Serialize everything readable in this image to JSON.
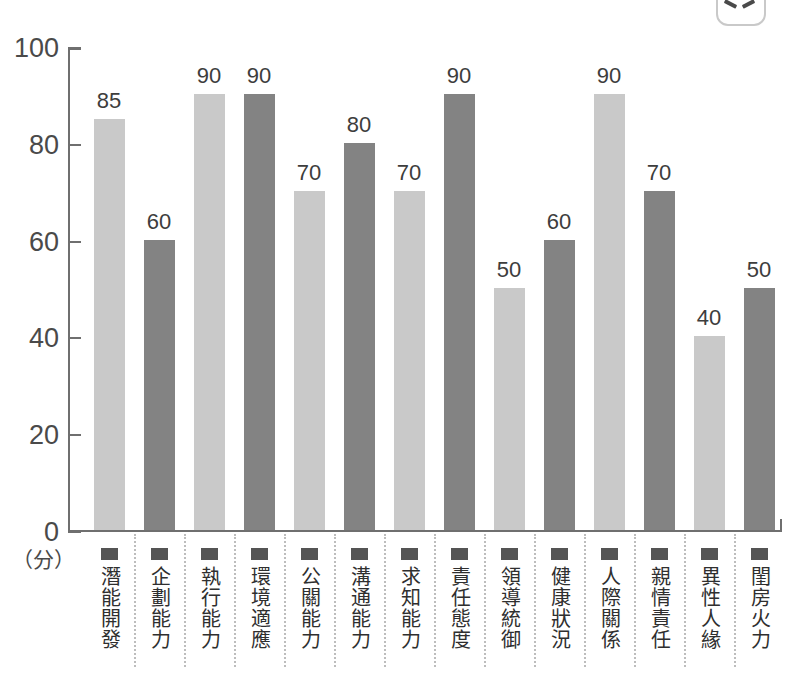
{
  "corner_badge": {
    "name": "cropped-badge"
  },
  "chart_data": {
    "type": "bar",
    "title": "",
    "subtitle": "",
    "xlabel": "",
    "ylabel": "",
    "unit_caption": "（分）",
    "ylim": [
      0,
      100
    ],
    "grid": false,
    "legend_position": "none",
    "yticks": [
      "0",
      "20",
      "40",
      "60",
      "80",
      "100"
    ],
    "ytick_values": [
      0,
      20,
      40,
      60,
      80,
      100
    ],
    "categories": [
      "潛能開發",
      "企劃能力",
      "執行能力",
      "環境適應",
      "公關能力",
      "溝通能力",
      "求知能力",
      "責任態度",
      "領導統御",
      "健康狀況",
      "人際關係",
      "親情責任",
      "異性人緣",
      "閨房火力"
    ],
    "values": [
      85,
      60,
      90,
      90,
      70,
      80,
      70,
      90,
      50,
      60,
      90,
      70,
      40,
      50
    ],
    "bar_shades": [
      "light",
      "dark",
      "light",
      "dark",
      "light",
      "dark",
      "light",
      "dark",
      "light",
      "dark",
      "light",
      "dark",
      "light",
      "dark"
    ],
    "colors": {
      "light_bar": "#c9c9c9",
      "dark_bar": "#838383",
      "axis": "#6f6f6f",
      "text": "#3d3d3d",
      "marker": "#545454",
      "separator": "#bdbdbd",
      "background": "#ffffff"
    }
  }
}
